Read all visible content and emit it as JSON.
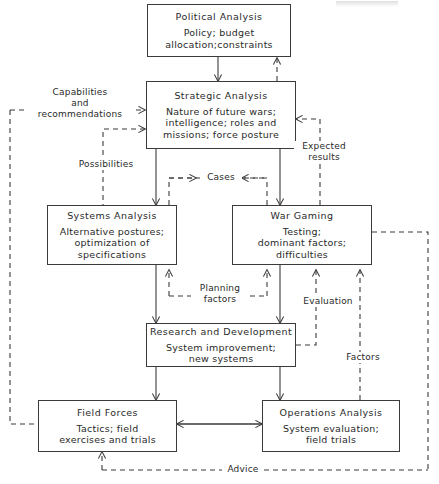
{
  "diagram": {
    "line_color": "#3b3b3b",
    "text_color": "#2a2a2a",
    "background": "#ffffff",
    "nodes": [
      {
        "id": "political-analysis",
        "title": "Political Analysis",
        "desc": "Policy; budget\nallocation;constraints"
      },
      {
        "id": "strategic-analysis",
        "title": "Strategic Analysis",
        "desc": "Nature of future wars;\nintelligence; roles and\nmissions; force posture"
      },
      {
        "id": "systems-analysis",
        "title": "Systems Analysis",
        "desc": "Alternative postures;\noptimization of\nspecifications"
      },
      {
        "id": "war-gaming",
        "title": "War Gaming",
        "desc": "Testing;\ndominant factors;\ndifficulties"
      },
      {
        "id": "research-and-development",
        "title": "Research and Development",
        "desc": "System improvement;\nnew systems"
      },
      {
        "id": "field-forces",
        "title": "Field Forces",
        "desc": "Tactics; field\nexercises and trials"
      },
      {
        "id": "operations-analysis",
        "title": "Operations Analysis",
        "desc": "System evaluation;\nfield trials"
      }
    ],
    "edge_labels": [
      {
        "id": "capabilities-and-recommendations",
        "text": "Capabilities\nand\nrecommendations"
      },
      {
        "id": "possibilities",
        "text": "Possibilities"
      },
      {
        "id": "expected-results",
        "text": "Expected\nresults"
      },
      {
        "id": "cases",
        "text": "Cases"
      },
      {
        "id": "planning-factors",
        "text": "Planning\nfactors"
      },
      {
        "id": "evaluation",
        "text": "Evaluation"
      },
      {
        "id": "factors",
        "text": "Factors"
      },
      {
        "id": "advice",
        "text": "Advice"
      }
    ]
  }
}
